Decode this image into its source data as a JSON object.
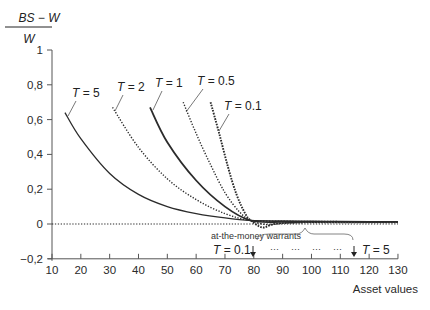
{
  "chart_data": {
    "type": "line",
    "title": "",
    "ylabel_numerator": "BS − W",
    "ylabel_denominator": "W",
    "xlabel": "Asset values",
    "xlim": [
      10,
      130
    ],
    "ylim": [
      -0.2,
      1
    ],
    "xticks": [
      10,
      20,
      30,
      40,
      50,
      60,
      70,
      80,
      90,
      100,
      110,
      120,
      130
    ],
    "yticks": [
      1,
      0.8,
      0.6,
      0.4,
      0.2,
      0,
      -0.2
    ],
    "ytick_labels": [
      "1",
      "0,8",
      "0,6",
      "0,4",
      "0,2",
      "0",
      "−0,2"
    ],
    "grid": false,
    "series": [
      {
        "name": "T = 5",
        "style": "solid",
        "width": 1.3,
        "x": [
          14.5,
          20,
          30,
          40,
          50,
          60,
          70,
          79,
          90,
          100,
          110,
          120,
          130
        ],
        "y": [
          0.64,
          0.49,
          0.29,
          0.17,
          0.1,
          0.06,
          0.035,
          0.02,
          0.018,
          0.016,
          0.015,
          0.014,
          0.013
        ]
      },
      {
        "name": "T = 2",
        "style": "dotted",
        "width": 1.4,
        "x": [
          31,
          40,
          50,
          60,
          70,
          79,
          90,
          100,
          110,
          120,
          130
        ],
        "y": [
          0.67,
          0.44,
          0.26,
          0.14,
          0.06,
          0.02,
          0.016,
          0.015,
          0.014,
          0.013,
          0.012
        ]
      },
      {
        "name": "T = 1",
        "style": "solid",
        "width": 1.8,
        "x": [
          44,
          50,
          60,
          70,
          79,
          90,
          100,
          110,
          120,
          130
        ],
        "y": [
          0.67,
          0.47,
          0.25,
          0.1,
          0.02,
          0.012,
          0.012,
          0.012,
          0.012,
          0.012
        ]
      },
      {
        "name": "T = 0.5",
        "style": "dotted",
        "width": 1.4,
        "x": [
          55.5,
          60,
          65,
          70,
          75,
          79,
          85,
          90,
          100,
          110,
          120,
          130
        ],
        "y": [
          0.7,
          0.52,
          0.34,
          0.18,
          0.07,
          0.02,
          -0.005,
          0.005,
          0.01,
          0.01,
          0.01,
          0.01
        ]
      },
      {
        "name": "T = 0.1",
        "style": "dotted-heavy",
        "width": 1.9,
        "x": [
          65,
          68,
          71,
          74,
          77,
          79,
          83,
          87,
          95,
          105,
          115,
          130
        ],
        "y": [
          0.7,
          0.52,
          0.33,
          0.17,
          0.06,
          0.02,
          -0.02,
          0.0,
          0.008,
          0.01,
          0.01,
          0.01
        ]
      },
      {
        "name": "zero baseline",
        "style": "dotted",
        "width": 1.2,
        "x": [
          10,
          130
        ],
        "y": [
          0,
          0
        ]
      }
    ],
    "annotations": [
      {
        "text": "at-the-money warrants",
        "x": 80,
        "y": -0.12
      },
      {
        "text": "T = 0.1",
        "arrow_x": 80,
        "y": -0.2
      },
      {
        "text": "T = 5",
        "arrow_x": 115,
        "y": -0.2
      },
      {
        "text": "···   ···   ···   ···"
      }
    ]
  },
  "labels": {
    "T5": "T = 5",
    "T2": "T = 2",
    "T1": "T = 1",
    "T05": "T = 0.5",
    "T01": "T = 0.1",
    "atm": "at-the-money warrants",
    "arrow_left": "T = 0.1",
    "arrow_right": "T = 5",
    "dots": "···"
  },
  "colors": {
    "line": "#2b2b2b",
    "axis": "#555555"
  }
}
